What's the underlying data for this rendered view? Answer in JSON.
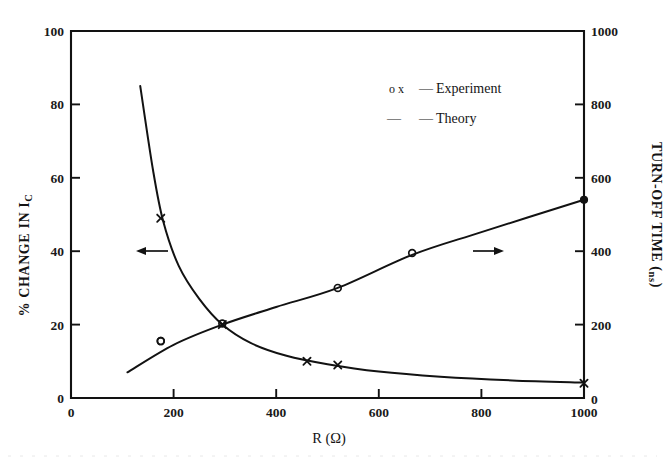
{
  "figure": {
    "background": "#ffffff",
    "ink_color": "#121212"
  },
  "axes": {
    "x": {
      "title": "R (Ω)",
      "ticks": [
        "0",
        "200",
        "400",
        "600",
        "800",
        "1000"
      ],
      "range": [
        0,
        1000
      ]
    },
    "y_left": {
      "title_main": "% CHANGE IN I",
      "title_sub": "C",
      "ticks": [
        "0",
        "20",
        "40",
        "60",
        "80",
        "100"
      ],
      "range": [
        0,
        100
      ]
    },
    "y_right": {
      "title_main": "TURN-OFF TIME (",
      "title_sub": "ns",
      "title_end": ")",
      "ticks": [
        "0",
        "200",
        "400",
        "600",
        "800",
        "1000"
      ],
      "range": [
        0,
        1000
      ]
    }
  },
  "legend": {
    "entries": [
      {
        "markers": "o x",
        "dash": "—",
        "label": "Experiment"
      },
      {
        "markers": "—",
        "dash": "—",
        "label": "Theory"
      }
    ]
  },
  "annotations": {
    "left_arrow": "left-arrow",
    "right_arrow": "right-arrow"
  },
  "chart_data": {
    "type": "line",
    "title": "",
    "xlabel": "R (Ω)",
    "ylabel": "% CHANGE IN Ic",
    "y2label": "TURN-OFF TIME (ns)",
    "xlim": [
      0,
      1000
    ],
    "ylim": [
      0,
      100
    ],
    "y2lim": [
      0,
      1000
    ],
    "grid": false,
    "legend_position": "upper-center",
    "series": [
      {
        "name": "% Change in Ic (Experiment, x markers)",
        "axis": "left",
        "marker": "x",
        "marker_points": [
          {
            "x": 175,
            "y": 49
          },
          {
            "x": 295,
            "y": 20
          },
          {
            "x": 460,
            "y": 10
          },
          {
            "x": 520,
            "y": 9
          },
          {
            "x": 1000,
            "y": 4
          }
        ]
      },
      {
        "name": "% Change in Ic (Theory, decaying curve)",
        "axis": "left",
        "marker": "none",
        "curve_points": [
          {
            "x": 135,
            "y": 85
          },
          {
            "x": 160,
            "y": 62
          },
          {
            "x": 180,
            "y": 48
          },
          {
            "x": 210,
            "y": 36
          },
          {
            "x": 250,
            "y": 27
          },
          {
            "x": 295,
            "y": 20
          },
          {
            "x": 350,
            "y": 15
          },
          {
            "x": 420,
            "y": 11.5
          },
          {
            "x": 500,
            "y": 9.2
          },
          {
            "x": 600,
            "y": 7.2
          },
          {
            "x": 720,
            "y": 5.8
          },
          {
            "x": 860,
            "y": 4.8
          },
          {
            "x": 1000,
            "y": 4.2
          }
        ]
      },
      {
        "name": "Turn-off time (Experiment, o markers)",
        "axis": "right",
        "marker": "o",
        "marker_points": [
          {
            "x": 175,
            "y": 155
          },
          {
            "x": 295,
            "y": 203
          },
          {
            "x": 520,
            "y": 300
          },
          {
            "x": 665,
            "y": 395
          },
          {
            "x": 1000,
            "y": 540
          }
        ]
      },
      {
        "name": "Turn-off time (Theory, rising curve)",
        "axis": "right",
        "marker": "none",
        "curve_points": [
          {
            "x": 110,
            "y": 70
          },
          {
            "x": 200,
            "y": 145
          },
          {
            "x": 295,
            "y": 200
          },
          {
            "x": 400,
            "y": 248
          },
          {
            "x": 520,
            "y": 300
          },
          {
            "x": 665,
            "y": 390
          },
          {
            "x": 800,
            "y": 452
          },
          {
            "x": 1000,
            "y": 540
          }
        ]
      }
    ]
  }
}
